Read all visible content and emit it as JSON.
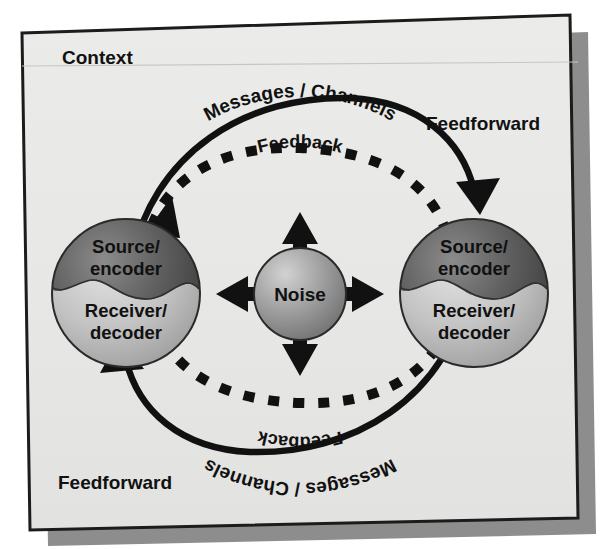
{
  "figure": {
    "kind": "transactional-communication-model-diagram",
    "context_label": "Context",
    "background_color": "#e8e8e6",
    "frame_border_color": "#1c1c1c",
    "shadow_color": "#8d8d8d",
    "ink_color": "#111111",
    "page_color": "#ffffff"
  },
  "nodes": {
    "left_sphere": {
      "top_label_line1": "Source/",
      "top_label_line2": "encoder",
      "bottom_label_line1": "Receiver/",
      "bottom_label_line2": "decoder",
      "top_fill": "#5a5a5a",
      "bottom_fill": "#b9b9b9"
    },
    "right_sphere": {
      "top_label_line1": "Source/",
      "top_label_line2": "encoder",
      "bottom_label_line1": "Receiver/",
      "bottom_label_line2": "decoder",
      "top_fill": "#5a5a5a",
      "bottom_fill": "#b9b9b9"
    },
    "noise": {
      "label": "Noise",
      "fill": "#9a9a9a",
      "arrow_directions": [
        "up",
        "right",
        "down",
        "left"
      ]
    }
  },
  "arcs": {
    "top_solid": {
      "label": "Messages / Channels",
      "style": "solid",
      "direction": "left-to-right",
      "arrowhead": "right-end"
    },
    "top_dashed": {
      "label": "Feedback",
      "style": "dashed",
      "direction": "right-to-left",
      "arrowhead": "left-end"
    },
    "bottom_solid": {
      "label": "Messages / Channels",
      "style": "solid",
      "direction": "right-to-left",
      "arrowhead": "left-end"
    },
    "bottom_dashed": {
      "label": "Feedback",
      "style": "dashed",
      "direction": "left-to-right",
      "arrowhead": "right-end"
    }
  },
  "annotations": {
    "feedforward_top_right": "Feedforward",
    "feedforward_bottom_left": "Feedforward"
  }
}
